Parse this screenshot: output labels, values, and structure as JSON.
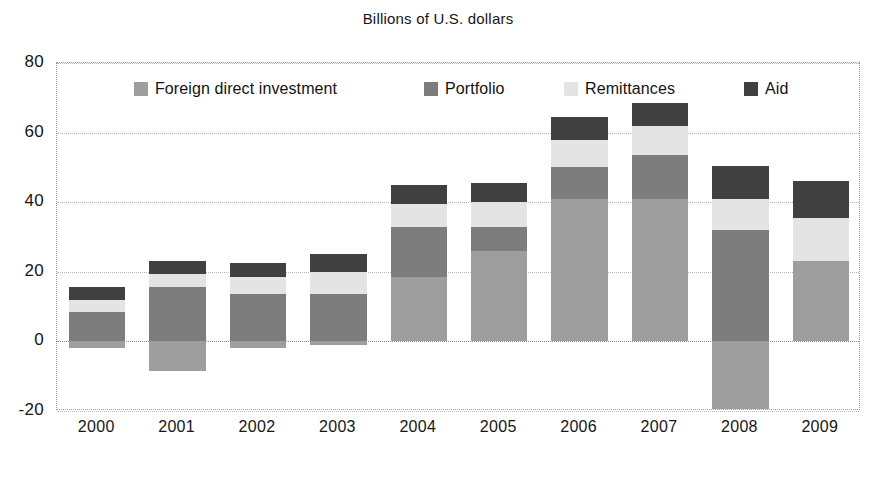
{
  "chart_data": {
    "type": "bar",
    "stacked": true,
    "title": "Billions of U.S. dollars",
    "xlabel": "",
    "ylabel": "",
    "ylim": [
      -20,
      80
    ],
    "yticks": [
      80,
      60,
      40,
      20,
      0,
      -20
    ],
    "grid": true,
    "legend_position": "top-inside",
    "categories": [
      "2000",
      "2001",
      "2002",
      "2003",
      "2004",
      "2005",
      "2006",
      "2007",
      "2008",
      "2009"
    ],
    "series": [
      {
        "name": "Foreign direct investment",
        "color": "#9e9e9e",
        "values": [
          -2,
          -8.5,
          -2,
          -1,
          18.5,
          26,
          41,
          41,
          -19.5,
          23
        ]
      },
      {
        "name": "Portfolio",
        "color": "#7d7d7d",
        "values": [
          8.5,
          15.5,
          13.5,
          13.5,
          14.5,
          7,
          9,
          12.5,
          32,
          0
        ]
      },
      {
        "name": "Remittances",
        "color": "#e4e4e4",
        "values": [
          3.5,
          4,
          5,
          6.5,
          6.5,
          7,
          8,
          8.5,
          9,
          12.5
        ]
      },
      {
        "name": "Aid",
        "color": "#404040",
        "values": [
          3.5,
          3.5,
          4,
          5,
          5.5,
          5.5,
          6.5,
          6.5,
          9.5,
          10.5
        ]
      }
    ]
  },
  "axis": {
    "y_ticks": [
      "80",
      "60",
      "40",
      "20",
      "0",
      "-20"
    ],
    "x_ticks": [
      "2000",
      "2001",
      "2002",
      "2003",
      "2004",
      "2005",
      "2006",
      "2007",
      "2008",
      "2009"
    ]
  },
  "legend": {
    "items": [
      {
        "label": "Foreign direct investment",
        "color": "#9e9e9e",
        "icon": "legend-swatch-icon"
      },
      {
        "label": "Portfolio",
        "color": "#7d7d7d",
        "icon": "legend-swatch-icon"
      },
      {
        "label": "Remittances",
        "color": "#e4e4e4",
        "icon": "legend-swatch-icon"
      },
      {
        "label": "Aid",
        "color": "#404040",
        "icon": "legend-swatch-icon"
      }
    ]
  },
  "colors": {
    "frame": "#9a9a9a",
    "grid": "#b4b4b4",
    "text": "#161616",
    "background": "#ffffff"
  }
}
